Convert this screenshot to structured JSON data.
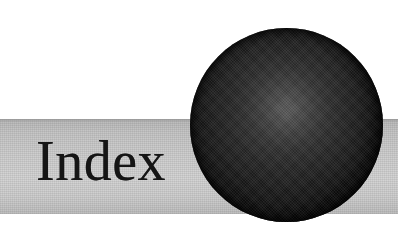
{
  "page": {
    "kind": "book-chapter-divider",
    "background_color": "#ffffff",
    "width": 398,
    "height": 237
  },
  "heading": {
    "text": "Index",
    "color": "#151515",
    "style": "serif"
  },
  "band": {
    "label": "grey-banner-stripe",
    "color_light": "#d4d4d4",
    "color_dark": "#b9b9b9",
    "top": 119,
    "height": 95
  },
  "sphere": {
    "label": "black-sphere-ornament",
    "fill_color": "#0a0a0a",
    "highlight_color": "#5a5a5a",
    "diameter": 193,
    "left": 190,
    "top": 28
  }
}
